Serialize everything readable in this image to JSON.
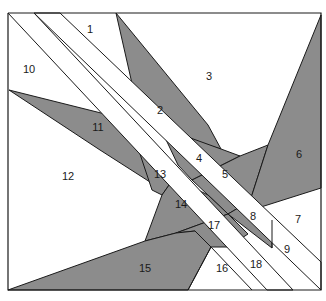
{
  "diagram": {
    "colors": {
      "shaded": "#8c8c8c",
      "background": "#ffffff",
      "line": "#1a1a1a"
    },
    "pieces": [
      {
        "id": "1",
        "label": "1",
        "shaded": false,
        "x": 90,
        "y": 33
      },
      {
        "id": "2",
        "label": "2",
        "shaded": true,
        "x": 160,
        "y": 114
      },
      {
        "id": "3",
        "label": "3",
        "shaded": false,
        "x": 209,
        "y": 80
      },
      {
        "id": "4",
        "label": "4",
        "shaded": true,
        "x": 199,
        "y": 162
      },
      {
        "id": "5",
        "label": "5",
        "shaded": true,
        "x": 225,
        "y": 178
      },
      {
        "id": "6",
        "label": "6",
        "shaded": true,
        "x": 299,
        "y": 158
      },
      {
        "id": "7",
        "label": "7",
        "shaded": false,
        "x": 298,
        "y": 223
      },
      {
        "id": "8",
        "label": "8",
        "shaded": true,
        "x": 253,
        "y": 220
      },
      {
        "id": "9",
        "label": "9",
        "shaded": false,
        "x": 287,
        "y": 253
      },
      {
        "id": "10",
        "label": "10",
        "shaded": false,
        "x": 29,
        "y": 73
      },
      {
        "id": "11",
        "label": "11",
        "shaded": true,
        "x": 98,
        "y": 131
      },
      {
        "id": "12",
        "label": "12",
        "shaded": false,
        "x": 68,
        "y": 180
      },
      {
        "id": "13",
        "label": "13",
        "shaded": true,
        "x": 160,
        "y": 178
      },
      {
        "id": "14",
        "label": "14",
        "shaded": true,
        "x": 181,
        "y": 208
      },
      {
        "id": "15",
        "label": "15",
        "shaded": true,
        "x": 145,
        "y": 272
      },
      {
        "id": "16",
        "label": "16",
        "shaded": false,
        "x": 222,
        "y": 272
      },
      {
        "id": "17",
        "label": "17",
        "shaded": true,
        "x": 214,
        "y": 229
      },
      {
        "id": "18",
        "label": "18",
        "shaded": false,
        "x": 256,
        "y": 268
      }
    ]
  }
}
